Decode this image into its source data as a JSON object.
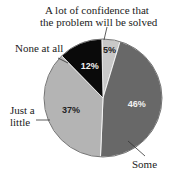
{
  "chart_data": {
    "type": "pie",
    "title": "",
    "slices": [
      {
        "label": "A lot of confidence that the problem will be solved",
        "value": 5,
        "pct_label": "5%",
        "color": "#c8c8c8"
      },
      {
        "label": "Some",
        "value": 46,
        "pct_label": "46%",
        "color": "#686868"
      },
      {
        "label": "Just a little",
        "value": 37,
        "pct_label": "37%",
        "color": "#b4b4b4"
      },
      {
        "label": "None at all",
        "value": 12,
        "pct_label": "12%",
        "color": "#0a0a0a"
      }
    ]
  },
  "labels": {
    "alot_line1": "A lot of confidence that",
    "alot_line2": "the problem will be solved",
    "none": "None at all",
    "little_line1": "Just a",
    "little_line2": "little",
    "some": "Some"
  }
}
